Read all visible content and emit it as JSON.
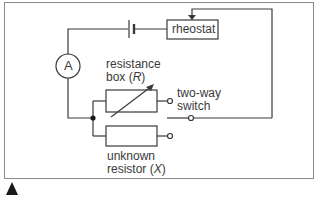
{
  "diagram": {
    "type": "circuit",
    "title": "",
    "components": {
      "ammeter": {
        "symbol": "A"
      },
      "rheostat": {
        "label": "rheostat"
      },
      "resistance_box": {
        "label_line1": "resistance",
        "label_line2_prefix": "box (",
        "label_line2_var": "R",
        "label_line2_suffix": ")"
      },
      "unknown_resistor": {
        "label_line1": "unknown",
        "label_line2_prefix": "resistor (",
        "label_line2_var": "X",
        "label_line2_suffix": ")"
      },
      "switch": {
        "label_line1": "two-way",
        "label_line2": "switch"
      },
      "cell": {
        "label": ""
      }
    },
    "colors": {
      "line": "#3a3a3a",
      "frame": "#8a8a8a",
      "background": "#ffffff"
    },
    "marker": {
      "icon": "triangle-up-icon"
    }
  }
}
